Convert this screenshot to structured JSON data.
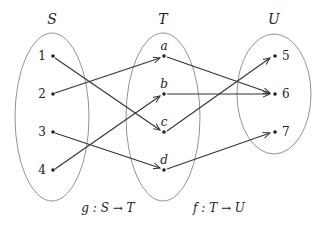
{
  "sets": [
    {
      "name": "S",
      "elements": [
        "1",
        "2",
        "3",
        "4"
      ]
    },
    {
      "name": "T",
      "elements": [
        "a",
        "b",
        "c",
        "d"
      ]
    },
    {
      "name": "U",
      "elements": [
        "5",
        "6",
        "7"
      ]
    }
  ],
  "mappings": {
    "g": [
      [
        "1",
        "c"
      ],
      [
        "2",
        "a"
      ],
      [
        "3",
        "d"
      ],
      [
        "4",
        "b"
      ]
    ],
    "f": [
      [
        "a",
        "6"
      ],
      [
        "b",
        "6"
      ],
      [
        "c",
        "5"
      ],
      [
        "d",
        "7"
      ]
    ]
  },
  "captions": {
    "g": "g : S → T",
    "f": "f : T → U"
  },
  "colors": {
    "line": "#333333",
    "ellipse": "#777777"
  }
}
